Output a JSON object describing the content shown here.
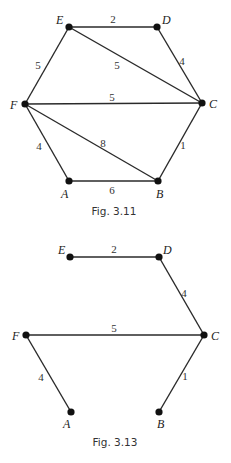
{
  "figures": [
    {
      "caption": "Fig. 3.11",
      "nodes": [
        {
          "id": "E",
          "label": "E",
          "x": 69,
          "y": 27,
          "lx": 56,
          "ly": 24
        },
        {
          "id": "D",
          "label": "D",
          "x": 157,
          "y": 27,
          "lx": 162,
          "ly": 24
        },
        {
          "id": "C",
          "label": "C",
          "x": 202,
          "y": 103,
          "lx": 209,
          "ly": 108
        },
        {
          "id": "F",
          "label": "F",
          "x": 25,
          "y": 104,
          "lx": 10,
          "ly": 109
        },
        {
          "id": "A",
          "label": "A",
          "x": 69,
          "y": 181,
          "lx": 61,
          "ly": 198
        },
        {
          "id": "B",
          "label": "B",
          "x": 158,
          "y": 181,
          "lx": 156,
          "ly": 198
        }
      ],
      "edges": [
        {
          "from": "E",
          "to": "D",
          "weight": "2",
          "lx": 113,
          "ly": 23
        },
        {
          "from": "E",
          "to": "C",
          "weight": "5",
          "lx": 117,
          "ly": 69
        },
        {
          "from": "D",
          "to": "C",
          "weight": "4",
          "lx": 182,
          "ly": 65
        },
        {
          "from": "E",
          "to": "F",
          "weight": "5",
          "lx": 38,
          "ly": 69
        },
        {
          "from": "F",
          "to": "C",
          "weight": "5",
          "lx": 112,
          "ly": 101
        },
        {
          "from": "F",
          "to": "A",
          "weight": "4",
          "lx": 39,
          "ly": 150
        },
        {
          "from": "F",
          "to": "B",
          "weight": "8",
          "lx": 103,
          "ly": 147
        },
        {
          "from": "C",
          "to": "B",
          "weight": "1",
          "lx": 183,
          "ly": 149
        },
        {
          "from": "A",
          "to": "B",
          "weight": "6",
          "lx": 112,
          "ly": 194
        }
      ],
      "caption_x": 114,
      "caption_y": 215
    },
    {
      "caption": "Fig. 3.13",
      "nodes": [
        {
          "id": "E",
          "label": "E",
          "x": 70,
          "y": 257,
          "lx": 58,
          "ly": 254
        },
        {
          "id": "D",
          "label": "D",
          "x": 159,
          "y": 257,
          "lx": 163,
          "ly": 254
        },
        {
          "id": "C",
          "label": "C",
          "x": 204,
          "y": 335,
          "lx": 211,
          "ly": 340
        },
        {
          "id": "F",
          "label": "F",
          "x": 26,
          "y": 335,
          "lx": 12,
          "ly": 340
        },
        {
          "id": "A",
          "label": "A",
          "x": 71,
          "y": 412,
          "lx": 63,
          "ly": 428
        },
        {
          "id": "B",
          "label": "B",
          "x": 159,
          "y": 412,
          "lx": 157,
          "ly": 428
        }
      ],
      "edges": [
        {
          "from": "E",
          "to": "D",
          "weight": "2",
          "lx": 114,
          "ly": 253
        },
        {
          "from": "D",
          "to": "C",
          "weight": "4",
          "lx": 184,
          "ly": 297
        },
        {
          "from": "F",
          "to": "C",
          "weight": "5",
          "lx": 114,
          "ly": 332
        },
        {
          "from": "F",
          "to": "A",
          "weight": "4",
          "lx": 41,
          "ly": 381
        },
        {
          "from": "C",
          "to": "B",
          "weight": "1",
          "lx": 185,
          "ly": 380
        }
      ],
      "caption_x": 115,
      "caption_y": 446
    }
  ]
}
